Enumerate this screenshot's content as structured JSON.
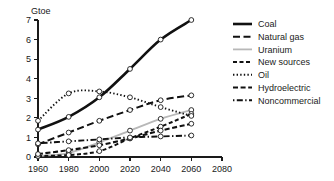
{
  "chart_data": {
    "type": "line",
    "title": "",
    "subtitle": "",
    "xlabel": "",
    "ylabel": "Gtoe",
    "xlim": [
      1960,
      2080
    ],
    "ylim": [
      0,
      7
    ],
    "xticks": [
      "1960",
      "1980",
      "2000",
      "2020",
      "2040",
      "2060",
      "2080"
    ],
    "xtick_values": [
      1960,
      1980,
      2000,
      2020,
      2040,
      2060,
      2080
    ],
    "yticks": [
      "0",
      "1",
      "2",
      "3",
      "4",
      "5",
      "6",
      "7"
    ],
    "ytick_values": [
      0,
      1,
      2,
      3,
      4,
      5,
      6,
      7
    ],
    "grid": false,
    "legend_position": "right",
    "markers": "open-circle",
    "x": [
      1960,
      1980,
      2000,
      2020,
      2040,
      2060
    ],
    "series": [
      {
        "name": "Coal",
        "style": "solid",
        "color": "#111111",
        "width": 2.6,
        "dash": "none",
        "values": [
          1.4,
          2.05,
          3.05,
          4.5,
          6.0,
          7.0
        ]
      },
      {
        "name": "Natural gas",
        "style": "long-dash",
        "color": "#111111",
        "width": 2.0,
        "dash": "7,3.5",
        "values": [
          0.65,
          1.25,
          1.85,
          2.4,
          2.9,
          3.15
        ]
      },
      {
        "name": "Uranium",
        "style": "solid-light",
        "color": "#b8b8b8",
        "width": 1.8,
        "dash": "none",
        "values": [
          0.05,
          0.2,
          0.75,
          1.35,
          1.95,
          2.4
        ]
      },
      {
        "name": "New sources",
        "style": "short-dash",
        "color": "#111111",
        "width": 2.0,
        "dash": "4,2.5",
        "values": [
          0.05,
          0.1,
          0.3,
          0.95,
          1.55,
          2.2
        ]
      },
      {
        "name": "Oil",
        "style": "dotted",
        "color": "#111111",
        "width": 1.9,
        "dash": "1.4,2.2",
        "values": [
          1.85,
          3.25,
          3.35,
          3.05,
          2.55,
          2.1
        ]
      },
      {
        "name": "Hydroelectric",
        "style": "medium-dash",
        "color": "#111111",
        "width": 2.1,
        "dash": "5,2.6",
        "values": [
          0.15,
          0.35,
          0.6,
          0.95,
          1.35,
          1.7
        ]
      },
      {
        "name": "Noncommercial",
        "style": "dash-dot",
        "color": "#111111",
        "width": 1.9,
        "dash": "1.4,2.4,6,2.4",
        "values": [
          0.7,
          0.8,
          0.9,
          1.0,
          1.05,
          1.1
        ]
      }
    ]
  },
  "legend": {
    "entries": [
      {
        "label": "Coal"
      },
      {
        "label": "Natural gas"
      },
      {
        "label": "Uranium"
      },
      {
        "label": "New sources"
      },
      {
        "label": "Oil"
      },
      {
        "label": "Hydroelectric"
      },
      {
        "label": "Noncommercial"
      }
    ]
  }
}
